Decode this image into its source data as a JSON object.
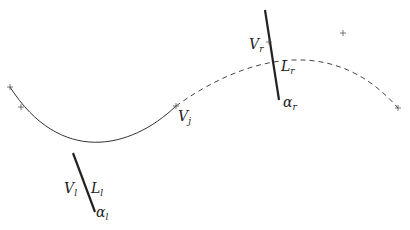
{
  "diagram": {
    "colors": {
      "curve": "#333333",
      "segment": "#222222",
      "marker": "#555555",
      "background": "#ffffff"
    },
    "curve": {
      "solid_from": [
        10,
        87
      ],
      "solid_ctrl": [
        60,
        165,
        130,
        150
      ],
      "joint": [
        176,
        106
      ],
      "dashed_ctrl": [
        240,
        60,
        330,
        30
      ],
      "dashed_end": [
        398,
        108
      ]
    },
    "markers": [
      {
        "name": "start-point",
        "x": 10,
        "y": 87
      },
      {
        "name": "left-control-point",
        "x": 21,
        "y": 107
      },
      {
        "name": "joint-point",
        "x": 176,
        "y": 106
      },
      {
        "name": "right-control-point",
        "x": 343,
        "y": 33
      },
      {
        "name": "end-point",
        "x": 398,
        "y": 108
      },
      {
        "name": "right-vertex-tick",
        "x": 269,
        "y": 42
      }
    ],
    "segments": {
      "right": {
        "x1": 265,
        "y1": 10,
        "x2": 279,
        "y2": 100
      },
      "left": {
        "x1": 73,
        "y1": 153,
        "x2": 95,
        "y2": 212
      }
    },
    "labels": {
      "vj": {
        "main": "V",
        "sub": "j",
        "x": 178,
        "y": 109
      },
      "vr": {
        "main": "V",
        "sub": "r",
        "x": 249,
        "y": 37
      },
      "lr": {
        "main": "L",
        "sub": "r",
        "x": 281,
        "y": 59
      },
      "ar": {
        "main": "α",
        "sub": "r",
        "x": 283,
        "y": 95
      },
      "vl": {
        "main": "V",
        "sub": "l",
        "x": 64,
        "y": 181
      },
      "ll": {
        "main": "L",
        "sub": "l",
        "x": 91,
        "y": 181
      },
      "al": {
        "main": "α",
        "sub": "l",
        "x": 96,
        "y": 205
      }
    }
  }
}
